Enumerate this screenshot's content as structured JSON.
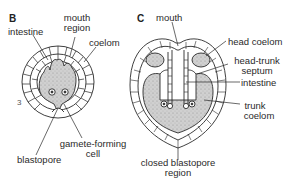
{
  "figure": {
    "panels": [
      {
        "letter": "B",
        "labels": {
          "intestine": "intestine",
          "mouth_region_1": "mouth",
          "mouth_region_2": "region",
          "coelom": "coelom",
          "gamete_1": "gamete-forming",
          "gamete_2": "cell",
          "blastopore": "blastopore"
        },
        "side_number": "3"
      },
      {
        "letter": "C",
        "labels": {
          "mouth": "mouth",
          "head_coelom": "head coelom",
          "septum_1": "head-trunk",
          "septum_2": "septum",
          "intestine": "intestine",
          "trunk_coelom_1": "trunk",
          "trunk_coelom_2": "coelom",
          "closed_blastopore_1": "closed blastopore",
          "closed_blastopore_2": "region"
        }
      }
    ],
    "colors": {
      "line": "#2a2a2a",
      "stipple_fill": "#c9c9c9",
      "background": "#ffffff"
    }
  }
}
